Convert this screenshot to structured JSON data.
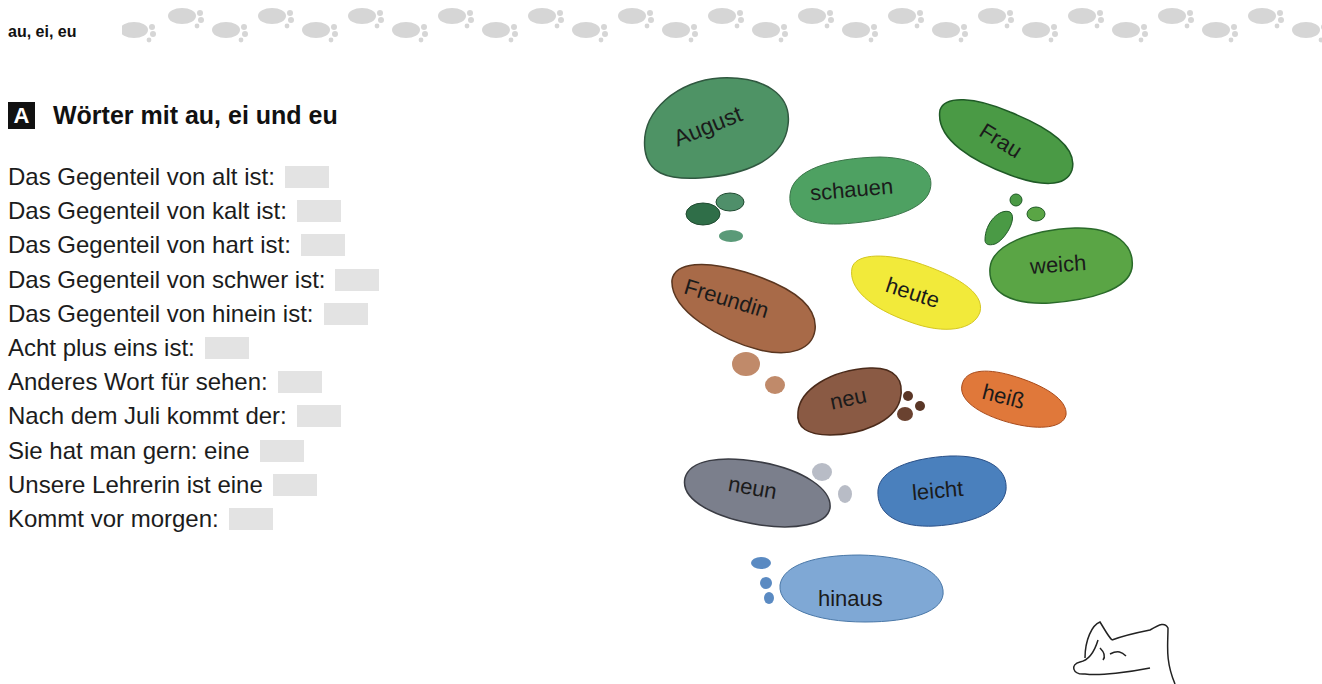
{
  "header": {
    "topic_label": "au, ei, eu",
    "decoration": "footprint-trail"
  },
  "section": {
    "badge": "A",
    "title": "Wörter mit au, ei und eu"
  },
  "tasks": [
    {
      "text": "Das Gegenteil von alt ist:",
      "answer": ""
    },
    {
      "text": "Das Gegenteil von kalt ist:",
      "answer": ""
    },
    {
      "text": "Das Gegenteil von hart ist:",
      "answer": ""
    },
    {
      "text": "Das Gegenteil von schwer ist:",
      "answer": ""
    },
    {
      "text": "Das Gegenteil von hinein ist:",
      "answer": ""
    },
    {
      "text": "Acht plus eins ist:",
      "answer": ""
    },
    {
      "text": "Anderes Wort für sehen:",
      "answer": ""
    },
    {
      "text": "Nach dem Juli kommt der:",
      "answer": ""
    },
    {
      "text": "Sie hat man gern: eine",
      "answer": ""
    },
    {
      "text": "Unsere Lehrerin ist eine",
      "answer": ""
    },
    {
      "text": "Kommt vor morgen:",
      "answer": ""
    }
  ],
  "word_prints": [
    {
      "word": "August",
      "color": "#3f8a58"
    },
    {
      "word": "schauen",
      "color": "#3f9a55"
    },
    {
      "word": "Frau",
      "color": "#4a9a45"
    },
    {
      "word": "weich",
      "color": "#5aa545"
    },
    {
      "word": "heute",
      "color": "#f2ea3a"
    },
    {
      "word": "Freundin",
      "color": "#a86a48"
    },
    {
      "word": "neu",
      "color": "#8a5a44"
    },
    {
      "word": "heiß",
      "color": "#e0783a"
    },
    {
      "word": "neun",
      "color": "#7b7f8c"
    },
    {
      "word": "leicht",
      "color": "#4a80bd"
    },
    {
      "word": "hinaus",
      "color": "#7fa8d5"
    }
  ],
  "illustration": "wolf-head-sketch"
}
